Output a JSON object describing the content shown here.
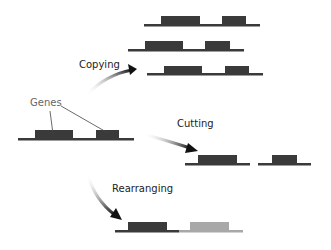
{
  "labels": {
    "genes": "Genes",
    "copying": "Copying",
    "cutting": "Cutting",
    "rearranging": "Rearranging"
  },
  "colors": {
    "dna_dark": "#3a3a3a",
    "dna_light": "#a8a8a8",
    "label_dark": "#222222",
    "label_gray": "#666666"
  }
}
